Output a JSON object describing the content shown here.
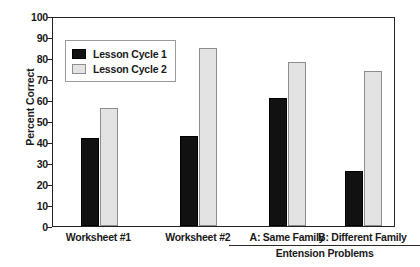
{
  "chart_data": {
    "type": "bar",
    "title": "",
    "xlabel": "",
    "ylabel": "Percent Correct",
    "ylim": [
      0,
      100
    ],
    "ytick_step": 10,
    "yticks": [
      100,
      90,
      80,
      70,
      60,
      50,
      40,
      30,
      20,
      10,
      0
    ],
    "grid": false,
    "legend_position": "upper-left-inside",
    "categories": [
      "Worksheet #1",
      "Worksheet #2",
      "A: Same Family",
      "B: Different Family"
    ],
    "series": [
      {
        "name": "Lesson Cycle 1",
        "color": "#111111",
        "values": [
          42,
          43,
          61,
          26
        ]
      },
      {
        "name": "Lesson Cycle 2",
        "color": "#e3e3e3",
        "values": [
          56,
          85,
          78,
          74
        ]
      }
    ],
    "group_annotation": {
      "label": "Entension Problems",
      "covers": [
        "A: Same Family",
        "B: Different Family"
      ]
    }
  },
  "axis": {
    "y_label": "Percent Correct",
    "ticks": [
      "100",
      "90",
      "80",
      "70",
      "60",
      "50",
      "40",
      "30",
      "20",
      "10",
      "0"
    ]
  },
  "legend": {
    "items": [
      {
        "label": "Lesson Cycle 1"
      },
      {
        "label": "Lesson Cycle 2"
      }
    ]
  },
  "xaxis": {
    "labels": [
      "Worksheet #1",
      "Worksheet #2",
      "A: Same Family",
      "B: Different Family"
    ],
    "group_label": "Entension Problems"
  }
}
